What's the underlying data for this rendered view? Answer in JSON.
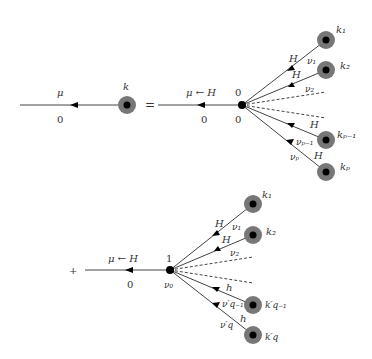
{
  "top": {
    "lhs_mu": "μ",
    "lhs_zero": "0",
    "lhs_k": "k",
    "equals": "=",
    "rhs_label": "μ ← H",
    "rhs_zero": "0",
    "vertex_top": "0",
    "vertex_bottom": "0",
    "k1": "k₁",
    "k2": "k₂",
    "kp1": "kₚ₋₁",
    "kp": "kₚ",
    "H": "H",
    "nu1": "ν₁",
    "nu2": "ν₂",
    "nup1": "νₚ₋₁",
    "nup": "νₚ"
  },
  "bottom": {
    "plus": "+",
    "label": "μ ← H",
    "zero": "0",
    "vertex_top": "1",
    "vertex_bottom": "ν₀",
    "k1": "k₁",
    "k2": "k₂",
    "kq1": "k′q₋₁",
    "kq": "k′q",
    "H": "H",
    "h": "h",
    "nu1": "ν₁",
    "nu2": "ν₂",
    "nuq1": "ν′q₋₁",
    "nuq": "ν′q"
  }
}
